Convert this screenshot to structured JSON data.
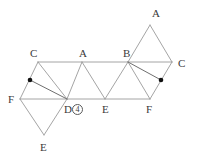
{
  "figure": {
    "stroke_color": "#9a9a9a",
    "accent_stroke_color": "#6f6f6f",
    "dot_color": "#111111",
    "label_color": "#3a3a3a",
    "background": "#ffffff",
    "width": 198,
    "height": 159
  },
  "vertices": [
    {
      "id": "c-left",
      "label": "C",
      "x": 38,
      "y": 62,
      "label_x": 30,
      "label_y": 48
    },
    {
      "id": "a-top-mid",
      "label": "A",
      "x": 82,
      "y": 62,
      "label_x": 79,
      "label_y": 48
    },
    {
      "id": "b-top",
      "label": "B",
      "x": 128,
      "y": 62,
      "label_x": 123,
      "label_y": 48
    },
    {
      "id": "c-right",
      "label": "C",
      "x": 172,
      "y": 62,
      "label_x": 178,
      "label_y": 58
    },
    {
      "id": "a-apex",
      "label": "A",
      "x": 150,
      "y": 25,
      "label_x": 152,
      "label_y": 8
    },
    {
      "id": "f-left",
      "label": "F",
      "x": 20,
      "y": 99,
      "label_x": 8,
      "label_y": 94
    },
    {
      "id": "d-bottom",
      "label": "D",
      "x": 67,
      "y": 99,
      "label_x": 64,
      "label_y": 104
    },
    {
      "id": "e-bottom-mid",
      "label": "E",
      "x": 105,
      "y": 99,
      "label_x": 102,
      "label_y": 104
    },
    {
      "id": "f-right",
      "label": "F",
      "x": 150,
      "y": 99,
      "label_x": 146,
      "label_y": 104
    },
    {
      "id": "e-apex",
      "label": "E",
      "x": 44,
      "y": 135,
      "label_x": 40,
      "label_y": 142
    }
  ],
  "midpoint_dots": [
    {
      "id": "dot-left",
      "x": 30,
      "y": 80,
      "r": 2.3,
      "on_segment": "c-left to f-left"
    },
    {
      "id": "dot-right",
      "x": 161,
      "y": 80,
      "r": 2.3,
      "on_segment": "c-right to f-right"
    }
  ],
  "edges": [
    {
      "id": "top-rail",
      "x1": 38,
      "y1": 62,
      "x2": 172,
      "y2": 62,
      "accent": false
    },
    {
      "id": "bottom-rail",
      "x1": 20,
      "y1": 99,
      "x2": 150,
      "y2": 99,
      "accent": false
    },
    {
      "id": "c-left-to-f",
      "x1": 38,
      "y1": 62,
      "x2": 20,
      "y2": 99,
      "accent": false
    },
    {
      "id": "c-left-to-d",
      "x1": 38,
      "y1": 62,
      "x2": 67,
      "y2": 99,
      "accent": false
    },
    {
      "id": "a-mid-to-d",
      "x1": 82,
      "y1": 62,
      "x2": 67,
      "y2": 99,
      "accent": false
    },
    {
      "id": "a-mid-to-e",
      "x1": 82,
      "y1": 62,
      "x2": 105,
      "y2": 99,
      "accent": false
    },
    {
      "id": "b-to-e",
      "x1": 128,
      "y1": 62,
      "x2": 105,
      "y2": 99,
      "accent": false
    },
    {
      "id": "b-to-f-right",
      "x1": 128,
      "y1": 62,
      "x2": 150,
      "y2": 99,
      "accent": false
    },
    {
      "id": "c-right-to-f",
      "x1": 172,
      "y1": 62,
      "x2": 150,
      "y2": 99,
      "accent": false
    },
    {
      "id": "b-to-a-apex",
      "x1": 128,
      "y1": 62,
      "x2": 150,
      "y2": 25,
      "accent": false
    },
    {
      "id": "a-apex-to-c",
      "x1": 150,
      "y1": 25,
      "x2": 172,
      "y2": 62,
      "accent": false
    },
    {
      "id": "f-left-to-e-apex",
      "x1": 20,
      "y1": 99,
      "x2": 44,
      "y2": 135,
      "accent": false
    },
    {
      "id": "e-apex-to-d",
      "x1": 44,
      "y1": 135,
      "x2": 67,
      "y2": 99,
      "accent": false
    },
    {
      "id": "dot-left-to-d",
      "x1": 30,
      "y1": 80,
      "x2": 67,
      "y2": 99,
      "accent": true
    },
    {
      "id": "dot-right-to-b",
      "x1": 161,
      "y1": 80,
      "x2": 128,
      "y2": 62,
      "accent": true
    }
  ],
  "annotations": {
    "d_marker": {
      "letter": "D",
      "circled_number": "4",
      "x": 64,
      "y": 104
    }
  }
}
